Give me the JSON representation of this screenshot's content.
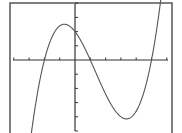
{
  "chart_data": {
    "type": "line",
    "title": "",
    "xlabel": "",
    "ylabel": "",
    "function": "y = 0.2(x+2)(x-1)(x-5)",
    "x_tick_spacing": 1,
    "y_tick_spacing": 1,
    "xlim": [
      -4,
      6.3
    ],
    "ylim": [
      -4.8,
      4.1
    ],
    "grid": false,
    "legend": null,
    "roots": [
      -2,
      1,
      5
    ],
    "y_intercept": 2,
    "local_max": {
      "x": -0.65,
      "y": 2.5
    },
    "local_min": {
      "x": 3.4,
      "y": -4.15
    },
    "series": [
      {
        "name": "f(x)",
        "x": [
          -2.8,
          -2.5,
          -2,
          -1.5,
          -1,
          -0.5,
          0,
          0.5,
          1,
          1.5,
          2,
          2.5,
          3,
          3.5,
          4,
          4.5,
          5,
          5.5,
          5.6
        ],
        "values": [
          -4.74,
          -2.1,
          0,
          1.4,
          2.16,
          2.36,
          2.0,
          1.35,
          0,
          -1.23,
          -2.4,
          -3.35,
          -4.0,
          -4.14,
          -3.6,
          -2.27,
          0,
          2.03,
          4.2
        ]
      }
    ]
  },
  "style": {
    "frame_color": "#555555",
    "axis_color": "#333333",
    "curve_color": "#555555",
    "background": "#ffffff"
  }
}
